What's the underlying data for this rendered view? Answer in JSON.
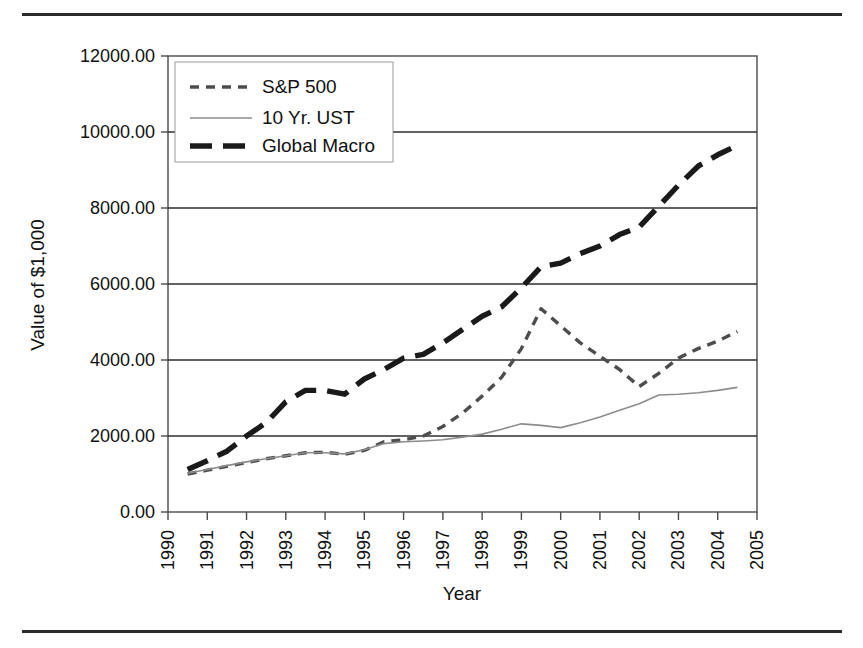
{
  "chart_data": {
    "type": "line",
    "title": "",
    "xlabel": "Year",
    "ylabel": "Value of $1,000",
    "xlim": [
      1990,
      2005
    ],
    "ylim": [
      0,
      12000
    ],
    "ytick_labels": [
      "0.00",
      "2000.00",
      "4000.00",
      "6000.00",
      "8000.00",
      "10000.00",
      "12000.00"
    ],
    "ytick_values": [
      0,
      2000,
      4000,
      6000,
      8000,
      10000,
      12000
    ],
    "xtick_labels": [
      "1990",
      "1991",
      "1992",
      "1993",
      "1994",
      "1995",
      "1996",
      "1997",
      "1998",
      "1999",
      "2000",
      "2001",
      "2002",
      "2003",
      "2004",
      "2005"
    ],
    "xtick_values": [
      1990,
      1991,
      1992,
      1993,
      1994,
      1995,
      1996,
      1997,
      1998,
      1999,
      2000,
      2001,
      2002,
      2003,
      2004,
      2005
    ],
    "grid": true,
    "grid_axis": "y",
    "legend_position": "upper left",
    "series": [
      {
        "name": "S&P 500",
        "style": "fine-dashed",
        "color": "#4d4d4d",
        "x": [
          1990.5,
          1991.0,
          1991.5,
          1992.0,
          1992.5,
          1993.0,
          1993.5,
          1994.0,
          1994.5,
          1995.0,
          1995.5,
          1996.0,
          1996.5,
          1997.0,
          1997.5,
          1998.0,
          1998.5,
          1999.0,
          1999.5,
          2000.0,
          2000.5,
          2001.0,
          2001.5,
          2002.0,
          2002.5,
          2003.0,
          2003.5,
          2004.0,
          2004.5
        ],
        "y": [
          1000,
          1100,
          1200,
          1300,
          1400,
          1480,
          1560,
          1570,
          1520,
          1620,
          1850,
          1900,
          2000,
          2250,
          2600,
          3050,
          3550,
          4300,
          5350,
          4900,
          4450,
          4100,
          3750,
          3300,
          3650,
          4050,
          4300,
          4500,
          4750
        ]
      },
      {
        "name": "10 Yr. UST",
        "style": "thin-solid",
        "color": "#8c8c8c",
        "x": [
          1990.5,
          1991.0,
          1991.5,
          1992.0,
          1992.5,
          1993.0,
          1993.5,
          1994.0,
          1994.5,
          1995.0,
          1995.5,
          1996.0,
          1996.5,
          1997.0,
          1997.5,
          1998.0,
          1998.5,
          1999.0,
          1999.5,
          2000.0,
          2000.5,
          2001.0,
          2001.5,
          2002.0,
          2002.5,
          2003.0,
          2003.5,
          2004.0,
          2004.5
        ],
        "y": [
          1020,
          1120,
          1220,
          1320,
          1400,
          1480,
          1560,
          1560,
          1530,
          1640,
          1800,
          1850,
          1870,
          1900,
          1970,
          2050,
          2180,
          2320,
          2280,
          2220,
          2350,
          2500,
          2680,
          2850,
          3080,
          3100,
          3140,
          3200,
          3280
        ]
      },
      {
        "name": "Global Macro",
        "style": "thick-dashed",
        "color": "#1a1a1a",
        "x": [
          1990.5,
          1991.0,
          1991.5,
          1992.0,
          1992.5,
          1993.0,
          1993.5,
          1994.0,
          1994.5,
          1995.0,
          1995.5,
          1996.0,
          1996.5,
          1997.0,
          1997.5,
          1998.0,
          1998.5,
          1999.0,
          1999.5,
          2000.0,
          2000.5,
          2001.0,
          2001.5,
          2002.0,
          2002.5,
          2003.0,
          2003.5,
          2004.0,
          2004.5
        ],
        "y": [
          1120,
          1350,
          1600,
          2000,
          2350,
          2900,
          3200,
          3200,
          3100,
          3500,
          3750,
          4050,
          4150,
          4450,
          4800,
          5150,
          5400,
          5900,
          6450,
          6550,
          6800,
          7000,
          7300,
          7500,
          8050,
          8600,
          9100,
          9400,
          9650
        ]
      }
    ]
  },
  "legend": {
    "items": [
      {
        "label": "S&P 500"
      },
      {
        "label": "10 Yr. UST"
      },
      {
        "label": "Global Macro"
      }
    ]
  }
}
